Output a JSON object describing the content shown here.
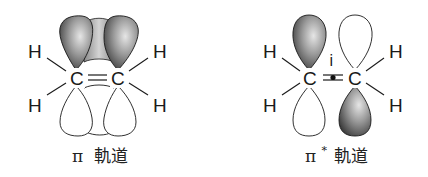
{
  "diagrams": [
    {
      "id": "pi",
      "caption_symbol": "π",
      "caption_text": "軌道",
      "caption": "π 軌道",
      "atoms": {
        "c1": "C",
        "c2": "C",
        "h": "H"
      },
      "bond": "double",
      "shaded_lobes": [
        "top-left",
        "top-right"
      ],
      "open_lobes": [
        "bottom-left",
        "bottom-right"
      ]
    },
    {
      "id": "pi-star",
      "caption_symbol": "π",
      "caption_superscript": "*",
      "caption_text": "軌道",
      "caption": "π*軌道",
      "atoms": {
        "c1": "C",
        "c2": "C",
        "h": "H"
      },
      "center_label": "i",
      "shaded_lobes": [
        "top-left",
        "bottom-right"
      ],
      "open_lobes": [
        "bottom-left",
        "top-right"
      ]
    }
  ],
  "colors": {
    "line": "#1a1a1a",
    "shade_dark": "#3a3a3a",
    "shade_light": "#d8d8d8",
    "background": "#ffffff"
  }
}
